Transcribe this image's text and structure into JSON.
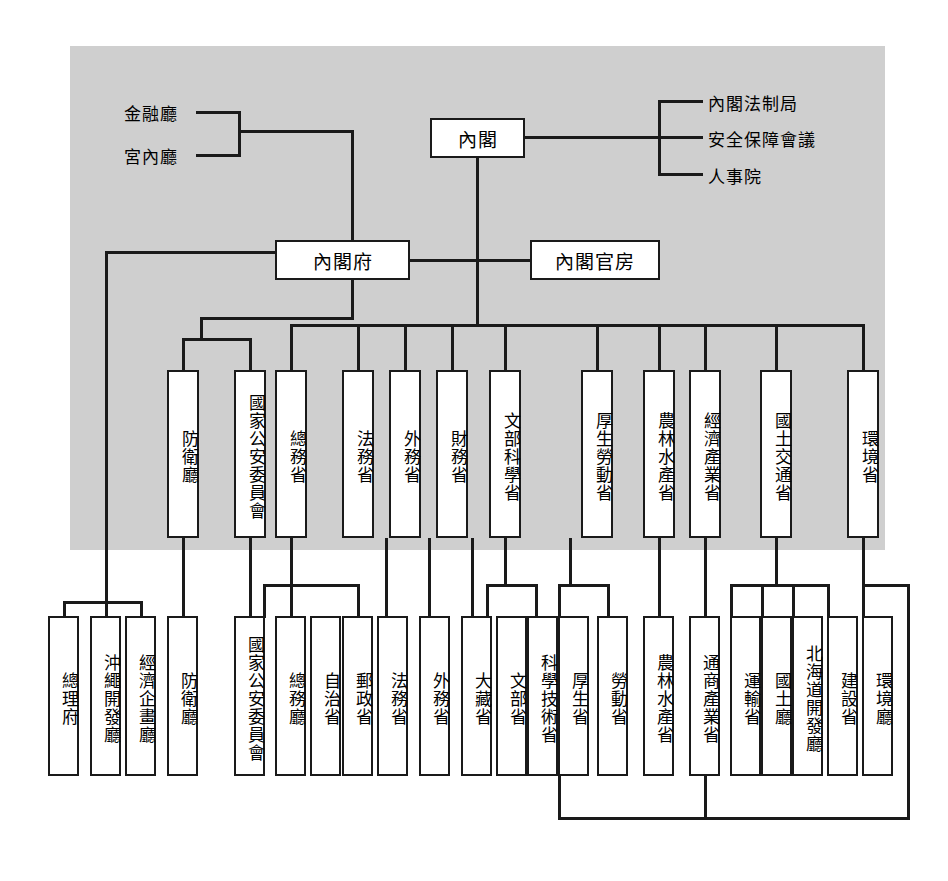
{
  "diagram": {
    "background_color": "#cfcfcf",
    "line_color": "#1a1a1a",
    "box_fill": "#ffffff"
  },
  "top": {
    "cabinet": "內閣",
    "cabinet_secretariat": "內閣官房",
    "cabinet_office": "內閣府"
  },
  "cabinet_attached": [
    {
      "label": "內閣法制局"
    },
    {
      "label": "安全保障會議"
    },
    {
      "label": "人事院"
    }
  ],
  "cabinet_office_attached": [
    {
      "label": "金融廳"
    },
    {
      "label": "宮內廳"
    }
  ],
  "new_agencies": [
    {
      "label": "防衛廳"
    },
    {
      "label": "國家公安委員會"
    }
  ],
  "new_ministries": [
    {
      "label": "總務省"
    },
    {
      "label": "法務省"
    },
    {
      "label": "外務省"
    },
    {
      "label": "財務省"
    },
    {
      "label": "文部科學省"
    },
    {
      "label": "厚生勞動省"
    },
    {
      "label": "農林水產省"
    },
    {
      "label": "經濟產業省"
    },
    {
      "label": "國土交通省"
    },
    {
      "label": "環境省"
    }
  ],
  "old_organs": [
    {
      "label": "總理府"
    },
    {
      "label": "沖繩開發廳"
    },
    {
      "label": "經濟企畫廳"
    },
    {
      "label": "防衛廳"
    },
    {
      "label": "國家公安委員會"
    },
    {
      "label": "總務廳"
    },
    {
      "label": "自治省"
    },
    {
      "label": "郵政省"
    },
    {
      "label": "法務省"
    },
    {
      "label": "外務省"
    },
    {
      "label": "大藏省"
    },
    {
      "label": "文部省"
    },
    {
      "label": "科學技術省"
    },
    {
      "label": "厚生省"
    },
    {
      "label": "勞動省"
    },
    {
      "label": "農林水產省"
    },
    {
      "label": "通商產業省"
    },
    {
      "label": "運輸省"
    },
    {
      "label": "國土廳"
    },
    {
      "label": "北海道開發廳"
    },
    {
      "label": "建設省"
    },
    {
      "label": "環境廳"
    }
  ]
}
